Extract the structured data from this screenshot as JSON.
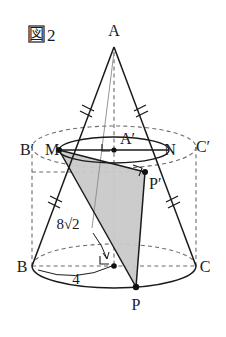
{
  "figure": {
    "tag_symbol": "図",
    "tag_number": "2",
    "caption_full": "図2"
  },
  "labels": {
    "apex": "A",
    "top_center": "A′",
    "top_left_cyl": "B′",
    "top_right_cyl": "C′",
    "chord_left": "M",
    "chord_right": "N",
    "base_left": "B",
    "base_right": "C",
    "base_point": "P",
    "upper_point": "P′"
  },
  "measures": {
    "slant_value": "8",
    "slant_radical": "√2",
    "slant_full": "8√2",
    "radius": "4"
  },
  "colors": {
    "stroke": "#1a1a1a",
    "dashed": "#6b6b6b",
    "shade_fill": "#c9c9c9",
    "shade_stroke": "#1a1a1a",
    "background": "#ffffff",
    "point_fill": "#111111"
  },
  "geometry": {
    "apex": {
      "x": 114,
      "y": 47
    },
    "top_ellipse_center": {
      "x": 114,
      "y": 147
    },
    "top_ellipse_rx": 82,
    "top_ellipse_ry": 21,
    "cone_ellipse_rx": 55,
    "cone_ellipse_ry": 13,
    "base_ellipse_center": {
      "x": 114,
      "y": 266
    },
    "base_ellipse_rx": 82,
    "base_ellipse_ry": 22,
    "point_M": {
      "x": 59,
      "y": 150
    },
    "point_N": {
      "x": 169,
      "y": 150
    },
    "point_B": {
      "x": 32,
      "y": 266
    },
    "point_C": {
      "x": 196,
      "y": 266
    },
    "point_P": {
      "x": 136,
      "y": 287
    },
    "point_Pprime": {
      "x": 145,
      "y": 172
    }
  },
  "marks": {
    "tick_count_per_segment": 2,
    "right_angle_markers": 3,
    "dots": [
      "A′",
      "M",
      "N",
      "P",
      "P′",
      "O"
    ]
  }
}
